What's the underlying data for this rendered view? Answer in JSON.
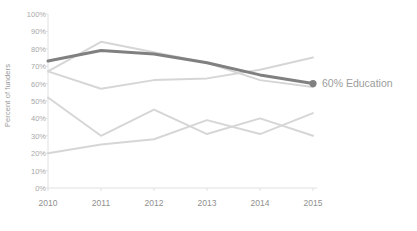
{
  "chart_data": {
    "type": "line",
    "title": "",
    "xlabel": "",
    "ylabel": "Percent of funders",
    "categories": [
      "2010",
      "2011",
      "2012",
      "2013",
      "2014",
      "2015"
    ],
    "x": [
      2010,
      2011,
      2012,
      2013,
      2014,
      2015
    ],
    "ylim": [
      0,
      100
    ],
    "ytick_labels": [
      "0%",
      "10%",
      "20%",
      "30%",
      "40%",
      "50%",
      "60%",
      "70%",
      "80%",
      "90%",
      "100%"
    ],
    "ytick_values": [
      0,
      10,
      20,
      30,
      40,
      50,
      60,
      70,
      80,
      90,
      100
    ],
    "grid": false,
    "legend": "none",
    "highlight_color": "#808080",
    "muted_color": "#d6d6d6",
    "axis_color": "#e0e0e0",
    "series": [
      {
        "name": "Education",
        "highlighted": true,
        "color": "#808080",
        "values": [
          73,
          79,
          77,
          72,
          65,
          60
        ],
        "end_marker": true
      },
      {
        "name": "series-2",
        "highlighted": false,
        "color": "#d6d6d6",
        "values": [
          67,
          84,
          78,
          72,
          62,
          58
        ]
      },
      {
        "name": "series-3",
        "highlighted": false,
        "color": "#d6d6d6",
        "values": [
          67,
          57,
          62,
          63,
          68,
          75
        ]
      },
      {
        "name": "series-4",
        "highlighted": false,
        "color": "#d6d6d6",
        "values": [
          52,
          30,
          45,
          31,
          40,
          30
        ]
      },
      {
        "name": "series-5",
        "highlighted": false,
        "color": "#d6d6d6",
        "values": [
          20,
          25,
          28,
          39,
          31,
          43
        ]
      }
    ],
    "annotations": [
      {
        "name": "education-end-label",
        "text": "60% Education",
        "value": 60,
        "at_category": "2015"
      }
    ]
  },
  "axis": {
    "y_title": "Percent of funders"
  }
}
